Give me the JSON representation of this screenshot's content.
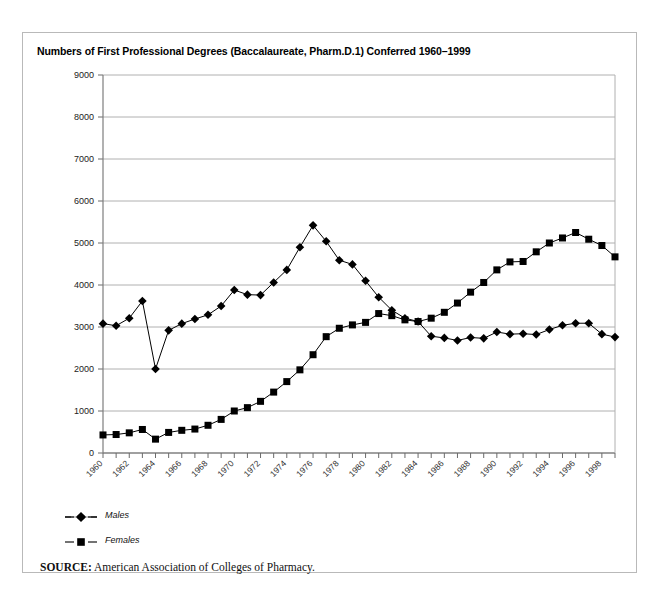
{
  "figure": {
    "title": "Numbers of First Professional Degrees (Baccalaureate, Pharm.D.1) Conferred 1960–1999",
    "source_label": "SOURCE:",
    "source_text": " American Association of Colleges of Pharmacy.",
    "border_color": "#b9b9b9"
  },
  "legend": {
    "males_label": "Males",
    "females_label": "Females"
  },
  "chart_data": {
    "type": "line",
    "title": "Numbers of First Professional Degrees (Baccalaureate, Pharm.D.1) Conferred 1960–1999",
    "xlabel": "",
    "ylabel": "",
    "xlim": [
      1960,
      1999
    ],
    "ylim": [
      0,
      9000
    ],
    "ytick_step": 1000,
    "yticks": [
      0,
      1000,
      2000,
      3000,
      4000,
      5000,
      6000,
      7000,
      8000,
      9000
    ],
    "ytick_labels": [
      "0",
      "1000",
      "2000",
      "3000",
      "4000",
      "5000",
      "6000",
      "7000",
      "8000",
      "9000"
    ],
    "grid": "horizontal",
    "legend_position": "below-left",
    "x": [
      1960,
      1961,
      1962,
      1963,
      1964,
      1965,
      1966,
      1967,
      1968,
      1969,
      1970,
      1971,
      1972,
      1973,
      1974,
      1975,
      1976,
      1977,
      1978,
      1979,
      1980,
      1981,
      1982,
      1983,
      1984,
      1985,
      1986,
      1987,
      1988,
      1989,
      1990,
      1991,
      1992,
      1993,
      1994,
      1995,
      1996,
      1997,
      1998,
      1999
    ],
    "xtick_labels": [
      "1960",
      "1962",
      "1964",
      "1966",
      "1968",
      "1970",
      "1972",
      "1974",
      "1976",
      "1978",
      "1980",
      "1982",
      "1984",
      "1986",
      "1988",
      "1990",
      "1992",
      "1994",
      "1996",
      "1998"
    ],
    "xtick_label_step": 2,
    "xtick_label_rotation": -45,
    "series": [
      {
        "name": "Males",
        "marker": "diamond",
        "color": "#000000",
        "values": [
          3080,
          3030,
          3210,
          3620,
          2000,
          2920,
          3080,
          3190,
          3290,
          3500,
          3880,
          3770,
          3760,
          4060,
          4360,
          4900,
          5420,
          5040,
          4590,
          4490,
          4100,
          3710,
          3400,
          3210,
          3130,
          2780,
          2740,
          2680,
          2750,
          2730,
          2880,
          2830,
          2840,
          2820,
          2940,
          3040,
          3090,
          3090,
          2830,
          2760
        ]
      },
      {
        "name": "Females",
        "marker": "square",
        "color": "#000000",
        "values": [
          430,
          440,
          480,
          560,
          330,
          490,
          540,
          570,
          660,
          800,
          1000,
          1080,
          1230,
          1450,
          1700,
          1980,
          2340,
          2770,
          2970,
          3050,
          3110,
          3320,
          3270,
          3170,
          3130,
          3210,
          3350,
          3570,
          3830,
          4060,
          4360,
          4550,
          4560,
          4790,
          5000,
          5120,
          5250,
          5090,
          4940,
          4670
        ]
      }
    ]
  }
}
